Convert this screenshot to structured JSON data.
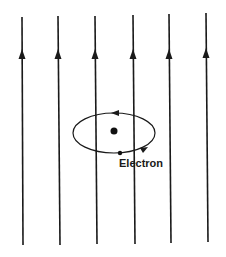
{
  "diagram": {
    "type": "magnetic field lines with orbiting electron",
    "field_lines": {
      "count": 6,
      "direction": "up",
      "color": "#1a1a1a",
      "x_positions": [
        22,
        58,
        95,
        133,
        169,
        206
      ],
      "y_top": 15,
      "y_bottom": 245,
      "arrow_y": 55
    },
    "orbit": {
      "shape": "ellipse",
      "cx": 114,
      "cy": 133,
      "rx": 41,
      "ry": 20,
      "direction": "counterclockwise (arrow left on top, right on bottom)"
    },
    "nucleus": {
      "cx": 114,
      "cy": 131,
      "r": 3.5
    },
    "electron": {
      "cx": 120,
      "cy": 153,
      "r": 2.2
    },
    "labels": {
      "electron": "Electron"
    }
  }
}
